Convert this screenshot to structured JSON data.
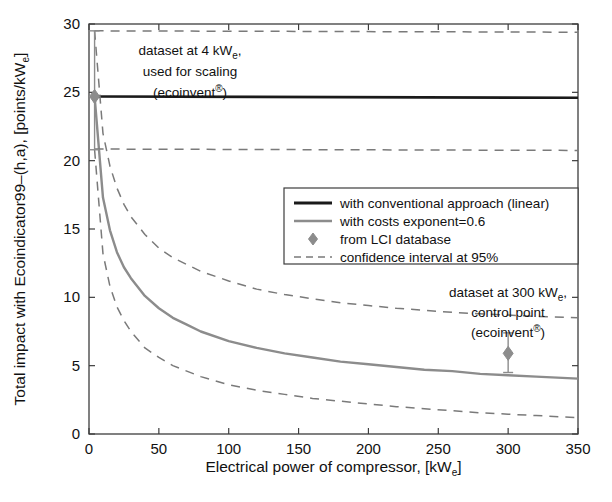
{
  "chart_data": {
    "type": "line",
    "title": "",
    "xlabel": "Electrical power of compressor, [kW",
    "xlabel_sub": "e",
    "xlabel_tail": "]",
    "ylabel": "Total impact with Ecoindicator99–(h,a), [points/kW",
    "ylabel_sub": "e",
    "ylabel_tail": "]",
    "xlim": [
      0,
      350
    ],
    "ylim": [
      0,
      30
    ],
    "xticks": [
      0,
      50,
      100,
      150,
      200,
      250,
      300,
      350
    ],
    "yticks": [
      0,
      5,
      10,
      15,
      20,
      25,
      30
    ],
    "xtick_labels": [
      "0",
      "50",
      "100",
      "150",
      "200",
      "250",
      "300",
      "350"
    ],
    "ytick_labels": [
      "0",
      "5",
      "10",
      "15",
      "20",
      "25",
      "30"
    ],
    "grid": false,
    "legend_position": "center-right",
    "series": [
      {
        "name": "with conventional approach (linear)",
        "style": "solid",
        "color": "#1a1a1a",
        "width": 2.6,
        "x": [
          4,
          350
        ],
        "values": [
          24.7,
          24.6
        ]
      },
      {
        "name": "with costs exponent=0.6",
        "style": "solid",
        "color": "#8c8c8c",
        "width": 2.4,
        "x": [
          4,
          10,
          15,
          20,
          25,
          30,
          40,
          50,
          60,
          70,
          80,
          100,
          120,
          140,
          160,
          180,
          200,
          220,
          240,
          260,
          280,
          300,
          320,
          350
        ],
        "values": [
          24.7,
          17.3,
          14.9,
          13.3,
          12.2,
          11.4,
          10.1,
          9.2,
          8.5,
          8.0,
          7.5,
          6.8,
          6.3,
          5.9,
          5.6,
          5.3,
          5.1,
          4.9,
          4.7,
          4.6,
          4.4,
          4.3,
          4.2,
          4.05
        ]
      },
      {
        "name": "confidence interval upper",
        "style": "dashed",
        "color": "#7a7a7a",
        "width": 1.5,
        "x": [
          4,
          10,
          15,
          20,
          25,
          30,
          40,
          50,
          60,
          80,
          100,
          120,
          140,
          160,
          180,
          200,
          220,
          240,
          260,
          280,
          300,
          320,
          350
        ],
        "values": [
          29.5,
          22.0,
          19.6,
          18.0,
          16.8,
          15.9,
          14.6,
          13.6,
          12.9,
          11.9,
          11.2,
          10.6,
          10.2,
          9.9,
          9.6,
          9.4,
          9.2,
          9.05,
          8.9,
          8.8,
          8.7,
          8.6,
          8.5
        ]
      },
      {
        "name": "confidence interval lower",
        "style": "dashed",
        "color": "#7a7a7a",
        "width": 1.5,
        "x": [
          4,
          10,
          15,
          20,
          25,
          30,
          40,
          50,
          60,
          80,
          100,
          120,
          140,
          160,
          180,
          200,
          220,
          240,
          260,
          280,
          300,
          320,
          350
        ],
        "values": [
          20.8,
          13.2,
          10.8,
          9.3,
          8.3,
          7.5,
          6.3,
          5.6,
          5.0,
          4.2,
          3.6,
          3.2,
          2.9,
          2.6,
          2.4,
          2.2,
          2.0,
          1.85,
          1.7,
          1.55,
          1.45,
          1.35,
          1.2
        ]
      },
      {
        "name": "conventional upper bound",
        "style": "dashed",
        "color": "#7a7a7a",
        "width": 1.5,
        "x": [
          4,
          350
        ],
        "values": [
          29.5,
          29.4
        ]
      },
      {
        "name": "conventional lower bound",
        "style": "dashed",
        "color": "#7a7a7a",
        "width": 1.5,
        "x": [
          4,
          350
        ],
        "values": [
          20.85,
          20.75
        ]
      }
    ],
    "points": [
      {
        "name": "dataset at 4 kWe",
        "x": 4,
        "y": 24.7,
        "err_low": 3.9,
        "err_high": 4.8,
        "marker": "diamond",
        "color": "#8c8c8c"
      },
      {
        "name": "from LCI database control point",
        "x": 300,
        "y": 5.9,
        "err_low": 1.4,
        "err_high": 1.5,
        "marker": "diamond",
        "color": "#8c8c8c"
      }
    ],
    "annotations": [
      {
        "id": "annot-4kwe",
        "lines": [
          "dataset at 4 kW",
          "used for scaling",
          "(ecoinvent"
        ],
        "line1_main": "dataset at 4 kW",
        "line1_sub": "e",
        "line1_tail": ",",
        "line2": "used for scaling",
        "line3_main": "(ecoinvent",
        "line3_sup": "®",
        "line3_tail": ")",
        "x": 190,
        "y": 55
      },
      {
        "id": "annot-300kwe",
        "line1_main": "dataset at 300 kW",
        "line1_sub": "e",
        "line1_tail": ",",
        "line2": "control point",
        "line3_main": "(ecoinvent",
        "line3_sup": "®",
        "line3_tail": ")",
        "x": 508,
        "y": 297
      }
    ],
    "legend": {
      "entries": [
        {
          "label": "with conventional approach (linear)",
          "type": "line-solid",
          "color": "#1a1a1a",
          "width": 2.8
        },
        {
          "label": "with costs exponent=0.6",
          "type": "line-solid",
          "color": "#8c8c8c",
          "width": 2.4
        },
        {
          "label": "from LCI database",
          "type": "marker-diamond",
          "color": "#8c8c8c",
          "width": 0
        },
        {
          "label": "confidence interval at 95%",
          "type": "line-dashed",
          "color": "#7a7a7a",
          "width": 1.6
        }
      ],
      "box": {
        "x": 284,
        "y": 188,
        "w": 294,
        "h": 76
      }
    },
    "colors": {
      "axis": "#3d3d3d",
      "conventional": "#1a1a1a",
      "exponent": "#8c8c8c",
      "confidence": "#7a7a7a",
      "background": "#ffffff"
    }
  }
}
